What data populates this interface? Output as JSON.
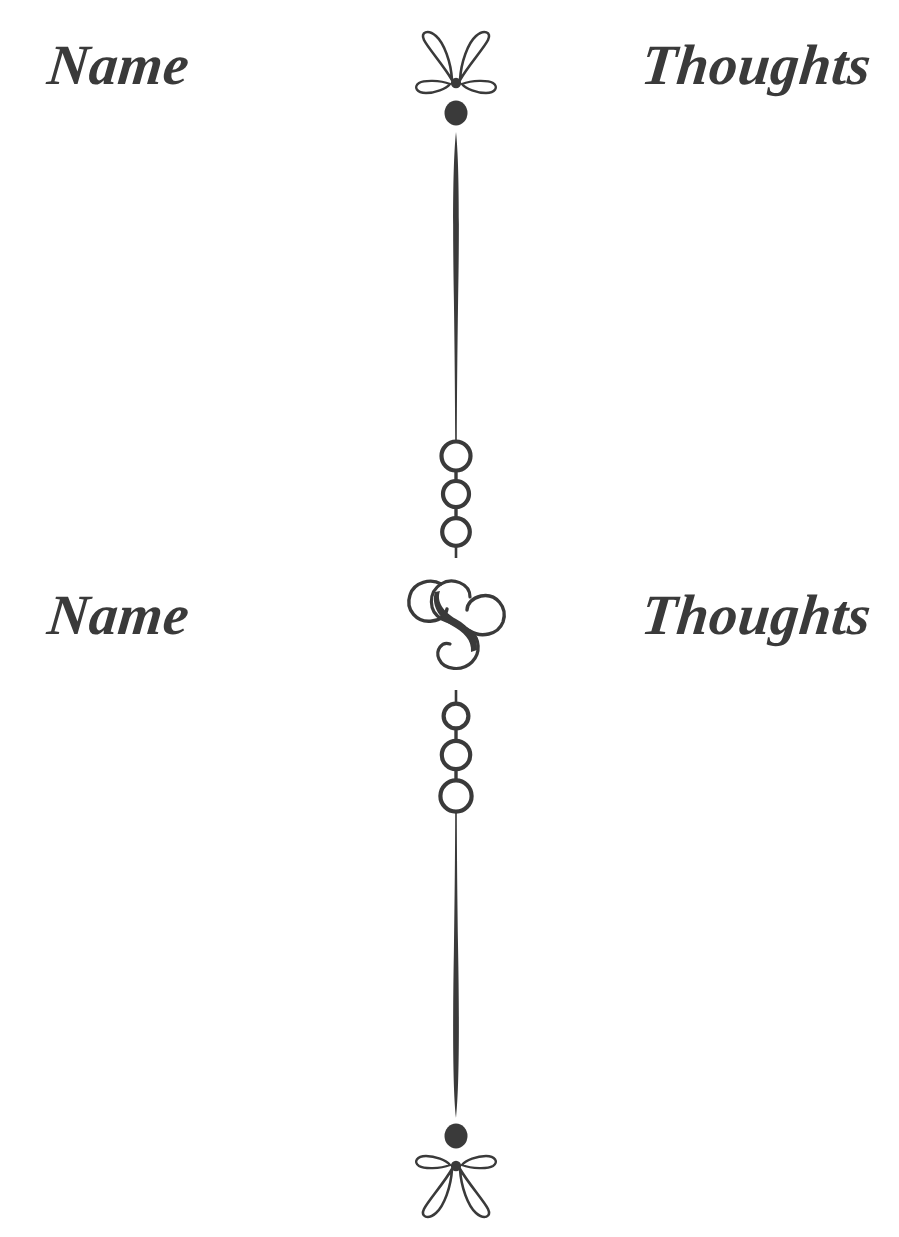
{
  "page": {
    "background_color": "#ffffff",
    "ink_color": "#3a3a3a",
    "width": 899,
    "height": 1237
  },
  "labels": {
    "name_top": "Name",
    "thoughts_top": "Thoughts",
    "name_mid": "Name",
    "thoughts_mid": "Thoughts"
  },
  "ornament": {
    "name": "vertical-divider-flourish",
    "axis_x": 456,
    "elements": [
      {
        "type": "flower-ornament",
        "position": "top",
        "y": 75,
        "orientation": "petals-up"
      },
      {
        "type": "filled-dot",
        "position": "top",
        "y": 113,
        "radius": 12
      },
      {
        "type": "tapered-line",
        "from_y": 130,
        "to_y": 440,
        "thick_end": "top",
        "max_width": 7,
        "min_width": 2
      },
      {
        "type": "ring-triplet",
        "position": "upper",
        "y_start": 440,
        "y_end": 548,
        "radii": [
          15,
          13,
          14
        ]
      },
      {
        "type": "s-scroll",
        "position": "center",
        "y": 625,
        "height": 105
      },
      {
        "type": "ring-triplet",
        "position": "lower",
        "y_start": 700,
        "y_end": 810,
        "radii": [
          12,
          14,
          16
        ]
      },
      {
        "type": "tapered-line",
        "from_y": 810,
        "to_y": 1120,
        "thick_end": "bottom",
        "max_width": 7,
        "min_width": 2
      },
      {
        "type": "filled-dot",
        "position": "bottom",
        "y": 1135,
        "radius": 12
      },
      {
        "type": "flower-ornament",
        "position": "bottom",
        "y": 1175,
        "orientation": "petals-down"
      }
    ]
  }
}
